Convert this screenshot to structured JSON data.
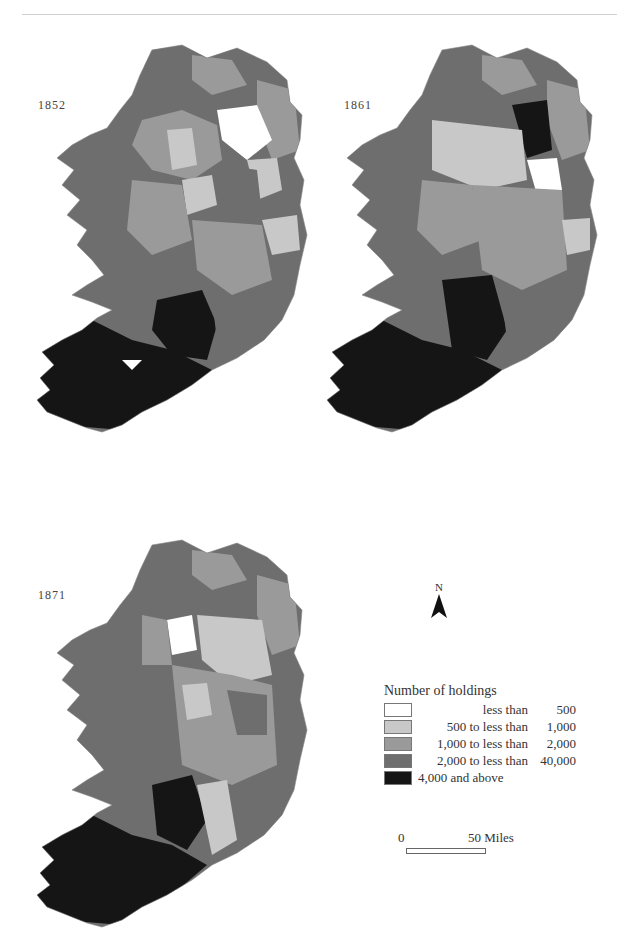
{
  "maps": [
    {
      "year": "1852"
    },
    {
      "year": "1861"
    },
    {
      "year": "1871"
    }
  ],
  "legend": {
    "title": "Number of holdings",
    "items": [
      {
        "label": "less than",
        "value": "500",
        "color": "#ffffff"
      },
      {
        "label": "500 to less than",
        "value": "1,000",
        "color": "#c8c8c8"
      },
      {
        "label": "1,000 to less than",
        "value": "2,000",
        "color": "#9a9a9a"
      },
      {
        "label": "2,000 to less than",
        "value": "40,000",
        "color": "#6e6e6e"
      },
      {
        "label": "4,000 and above",
        "value": "",
        "color": "#151515"
      }
    ]
  },
  "north_arrow": {
    "letter": "N"
  },
  "scale_bar": {
    "start": "0",
    "end": "50 Miles"
  },
  "colors": {
    "c0": "#ffffff",
    "c1": "#c8c8c8",
    "c2": "#9a9a9a",
    "c3": "#6e6e6e",
    "c4": "#151515",
    "border": "#e6e6e6"
  }
}
